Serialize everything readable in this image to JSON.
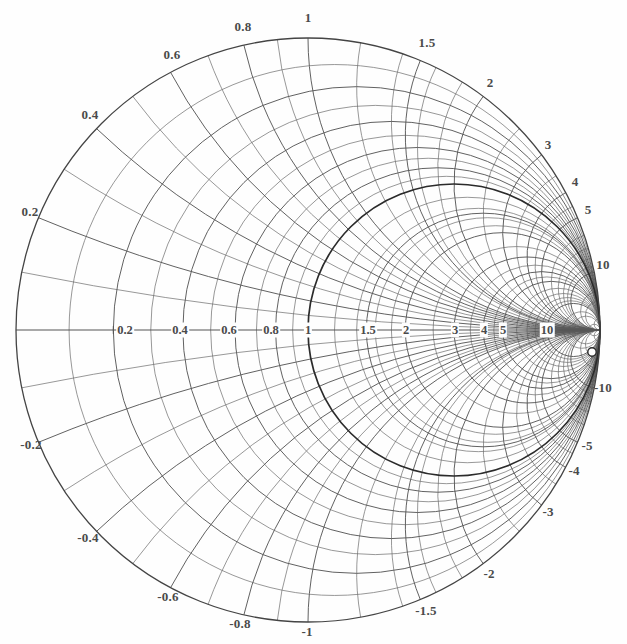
{
  "chart_data": {
    "type": "smith",
    "title": "",
    "subtitle": "",
    "xlabel": "",
    "ylabel": "",
    "normalization": 1,
    "center_px": [
      308,
      330
    ],
    "radius_px": 292,
    "grid": true,
    "legend": false,
    "resistance_circles": [
      0.2,
      0.4,
      0.6,
      0.8,
      1,
      1.5,
      2,
      3,
      4,
      5,
      10
    ],
    "resistance_minor_circles": [
      0.1,
      0.3,
      0.5,
      0.7,
      0.9,
      1.2,
      1.4,
      1.6,
      1.8,
      2.5,
      3.5,
      4.5,
      6,
      7,
      8,
      9,
      15,
      20,
      50
    ],
    "reactance_arcs": [
      0.2,
      0.4,
      0.6,
      0.8,
      1,
      1.5,
      2,
      3,
      4,
      5,
      10
    ],
    "reactance_minor_arcs": [
      0.1,
      0.3,
      0.5,
      0.7,
      0.9,
      1.2,
      1.4,
      1.6,
      1.8,
      2.5,
      3.5,
      4.5,
      6,
      7,
      8,
      9,
      15,
      20,
      50
    ],
    "bold_circle": {
      "kind": "resistance",
      "value": 1
    },
    "marker": {
      "label": "",
      "x_px": 592,
      "y_px": 352
    },
    "axis_ticks_left": [
      "0.2",
      "0.4",
      "0.6",
      "0.8",
      "1"
    ],
    "axis_ticks_right": [
      "1.5",
      "2",
      "3",
      "4",
      "5",
      "10"
    ]
  },
  "axis": {
    "name": "real-axis",
    "labels": [
      {
        "text": "0.2",
        "value": 0.2,
        "x": 125,
        "y": 330
      },
      {
        "text": "0.4",
        "value": 0.4,
        "x": 180,
        "y": 330
      },
      {
        "text": "0.6",
        "value": 0.6,
        "x": 229,
        "y": 330
      },
      {
        "text": "0.8",
        "value": 0.8,
        "x": 271,
        "y": 330
      },
      {
        "text": "1",
        "value": 1.0,
        "x": 308,
        "y": 330
      },
      {
        "text": "1.5",
        "value": 1.5,
        "x": 368,
        "y": 330
      },
      {
        "text": "2",
        "value": 2.0,
        "x": 406,
        "y": 330
      },
      {
        "text": "3",
        "value": 3.0,
        "x": 455,
        "y": 330
      },
      {
        "text": "4",
        "value": 4.0,
        "x": 484,
        "y": 330
      },
      {
        "text": "5",
        "value": 5.0,
        "x": 503,
        "y": 330
      },
      {
        "text": "10",
        "value": 10.0,
        "x": 547,
        "y": 330
      }
    ]
  },
  "upper_labels": [
    {
      "text": "0.2",
      "value": 0.2,
      "x": 30,
      "y": 212
    },
    {
      "text": "0.4",
      "value": 0.4,
      "x": 90,
      "y": 115
    },
    {
      "text": "0.6",
      "value": 0.6,
      "x": 172,
      "y": 55
    },
    {
      "text": "0.8",
      "value": 0.8,
      "x": 243,
      "y": 27
    },
    {
      "text": "1",
      "value": 1.0,
      "x": 308,
      "y": 18
    },
    {
      "text": "1.5",
      "value": 1.5,
      "x": 427,
      "y": 43
    },
    {
      "text": "2",
      "value": 2.0,
      "x": 490,
      "y": 83
    },
    {
      "text": "3",
      "value": 3.0,
      "x": 548,
      "y": 145
    },
    {
      "text": "4",
      "value": 4.0,
      "x": 575,
      "y": 182
    },
    {
      "text": "5",
      "value": 5.0,
      "x": 588,
      "y": 210
    },
    {
      "text": "10",
      "value": 10.0,
      "x": 603,
      "y": 265
    }
  ],
  "lower_labels": [
    {
      "text": "-0.2",
      "value": -0.2,
      "x": 31,
      "y": 445
    },
    {
      "text": "-0.4",
      "value": -0.4,
      "x": 88,
      "y": 538
    },
    {
      "text": "-0.6",
      "value": -0.6,
      "x": 168,
      "y": 597
    },
    {
      "text": "-0.8",
      "value": -0.8,
      "x": 240,
      "y": 624
    },
    {
      "text": "-1",
      "value": -1.0,
      "x": 307,
      "y": 632
    },
    {
      "text": "-1.5",
      "value": -1.5,
      "x": 426,
      "y": 611
    },
    {
      "text": "-2",
      "value": -2.0,
      "x": 489,
      "y": 574
    },
    {
      "text": "-3",
      "value": -3.0,
      "x": 548,
      "y": 512
    },
    {
      "text": "-4",
      "value": -4.0,
      "x": 574,
      "y": 471
    },
    {
      "text": "-5",
      "value": -5.0,
      "x": 587,
      "y": 446
    },
    {
      "text": "-10",
      "value": -10.0,
      "x": 603,
      "y": 388
    }
  ],
  "colors": {
    "background": "#fefefe",
    "grid_minor": "#6b6b6b",
    "grid_major": "#585858",
    "grid_bold": "#2b2b2b",
    "text": "#4a4a4a",
    "marker_fill": "#fdfdfd",
    "marker_stroke": "#2a2a2a"
  }
}
